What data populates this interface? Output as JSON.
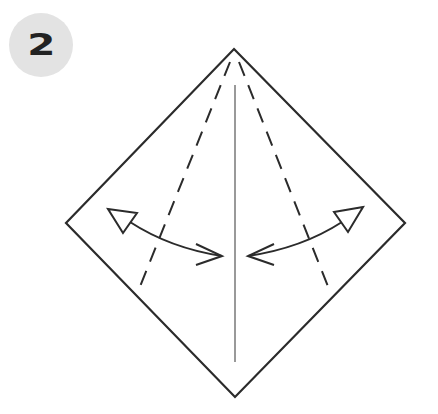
{
  "step": {
    "number": "2"
  },
  "diagram": {
    "shape": "square-rotated-diamond",
    "vertices": {
      "top": [
        234,
        49
      ],
      "right": [
        405,
        223
      ],
      "bottom": [
        235,
        397
      ],
      "left": [
        66,
        223
      ]
    },
    "center_crease": {
      "x": 235,
      "y1": 85,
      "y2": 362
    },
    "valley_folds": [
      {
        "side": "left",
        "from": [
          231,
          60
        ],
        "to": [
          137,
          294
        ]
      },
      {
        "side": "right",
        "from": [
          238,
          60
        ],
        "to": [
          331,
          294
        ]
      }
    ],
    "arrows": [
      {
        "side": "left",
        "type": "fold-and-unfold",
        "open_head": [
          108,
          212
        ],
        "closed_head": [
          222,
          256
        ]
      },
      {
        "side": "right",
        "type": "fold-and-unfold",
        "open_head": [
          362,
          210
        ],
        "closed_head": [
          248,
          256
        ]
      }
    ],
    "colors": {
      "line": "#2b2b2b",
      "badge": "#e3e3e3",
      "badge_text": "#222222"
    }
  }
}
